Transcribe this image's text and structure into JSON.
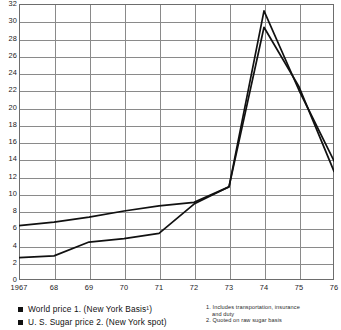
{
  "chart_data": {
    "type": "line",
    "title": "",
    "subtitle": "",
    "xlabel": "",
    "ylabel": "",
    "x": [
      1967,
      1968,
      1969,
      1970,
      1971,
      1972,
      1973,
      1974,
      1975,
      1976
    ],
    "categories": [
      "1967",
      "68",
      "69",
      "70",
      "71",
      "72",
      "73",
      "74",
      "75",
      "76"
    ],
    "xlim": [
      1967,
      1976
    ],
    "ylim": [
      0,
      32
    ],
    "ytick_step": 2,
    "yticks": [
      0,
      2,
      4,
      6,
      8,
      10,
      12,
      14,
      16,
      18,
      20,
      22,
      24,
      26,
      28,
      30,
      32
    ],
    "ytick_labels": [
      "0",
      "2",
      "4",
      "6",
      "8",
      "10",
      "12",
      "14",
      "16",
      "18",
      "20",
      "22",
      "24",
      "26",
      "28",
      "30",
      "32"
    ],
    "grid": true,
    "grid_axis": "both",
    "legend_position": "bottom-left",
    "series": [
      {
        "name": "World price 1. (New York Basis¹)",
        "color": "#111111",
        "values": [
          6.3,
          6.7,
          7.3,
          8.0,
          8.6,
          9.0,
          10.8,
          31.2,
          22.0,
          13.8
        ]
      },
      {
        "name": "U. S. Sugar price 2. (New York spot)",
        "color": "#111111",
        "values": [
          2.6,
          2.8,
          4.4,
          4.8,
          5.4,
          8.8,
          10.8,
          29.3,
          22.4,
          12.6
        ]
      }
    ]
  },
  "legend": {
    "items": [
      {
        "label": "World price 1. (New York Basis¹)",
        "color": "#111111"
      },
      {
        "label": "U. S. Sugar price 2. (New York spot)",
        "color": "#111111"
      }
    ]
  },
  "footnotes": [
    {
      "line1": "1. Includes transportation, insurance",
      "line2": "and duty"
    },
    {
      "line1": "2. Quoted on raw sugar basis",
      "line2": ""
    }
  ],
  "colors": {
    "line": "#111111",
    "grid": "#8a8a8a",
    "frame": "#6d6d6d",
    "background": "#ffffff",
    "text": "#111111"
  }
}
